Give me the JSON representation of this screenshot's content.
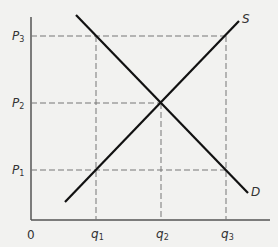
{
  "diagram": {
    "title": "",
    "type": "supply-demand",
    "axes": {
      "origin_label": "0",
      "x_axis": "quantity",
      "y_axis": "price"
    },
    "price_levels": [
      {
        "base": "P",
        "sub": "3",
        "y": 36
      },
      {
        "base": "P",
        "sub": "2",
        "y": 103
      },
      {
        "base": "P",
        "sub": "1",
        "y": 170
      }
    ],
    "quantity_levels": [
      {
        "base": "q",
        "sub": "1",
        "x": 96
      },
      {
        "base": "q",
        "sub": "2",
        "x": 161
      },
      {
        "base": "q",
        "sub": "3",
        "x": 226
      }
    ],
    "curves": {
      "supply": {
        "label": "S",
        "from": [
          65,
          202
        ],
        "to": [
          239,
          21
        ]
      },
      "demand": {
        "label": "D",
        "from": [
          76,
          15
        ],
        "to": [
          248,
          193
        ]
      }
    },
    "equilibrium": {
      "price": "P2",
      "quantity": "q2"
    },
    "colors": {
      "background": "#f2f2f0",
      "axis": "#555555",
      "curve": "#111111",
      "guide": "#777777",
      "text": "#333333"
    }
  }
}
